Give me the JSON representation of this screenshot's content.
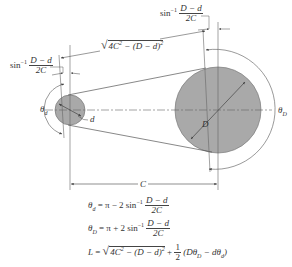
{
  "diagram": {
    "colors": {
      "line": "#555555",
      "pulley_fill": "#a9a9a9",
      "pulley_stroke": "#777777",
      "text": "#333333"
    },
    "labels": {
      "sin_inv_left_prefix": "sin",
      "sin_inv_left_exp": "−1",
      "sin_inv_left_num": "D − d",
      "sin_inv_left_den": "2C",
      "sin_inv_right_prefix": "sin",
      "sin_inv_right_exp": "−1",
      "sin_inv_right_num": "D − d",
      "sin_inv_right_den": "2C",
      "tangent_length_a": "4C",
      "tangent_length_a_exp": "2",
      "tangent_length_b": " − (D − d)",
      "tangent_length_b_exp": "2",
      "theta_d": "θ",
      "theta_d_sub": "d",
      "theta_D": "θ",
      "theta_D_sub": "D",
      "small_diameter": "d",
      "large_diameter": "D",
      "center_distance": "C"
    },
    "equations": {
      "eq1": {
        "lhs": "θ",
        "lhs_sub": "d",
        "rhs": " = π − 2 sin",
        "exp": "−1",
        "num": "D − d",
        "den": "2C"
      },
      "eq2": {
        "lhs": "θ",
        "lhs_sub": "D",
        "rhs": " = π + 2 sin",
        "exp": "−1",
        "num": "D − d",
        "den": "2C"
      },
      "eq3": {
        "lhs": "L",
        "eq": " = ",
        "rad_a": "4C",
        "rad_a_exp": "2",
        "rad_b": " − (D − d)",
        "rad_b_exp": "2",
        "plus": " + ",
        "half_num": "1",
        "half_den": "2",
        "tail_open": " (Dθ",
        "tail_sub1": "D",
        "tail_mid": " − dθ",
        "tail_sub2": "d",
        "tail_close": ")"
      }
    }
  }
}
